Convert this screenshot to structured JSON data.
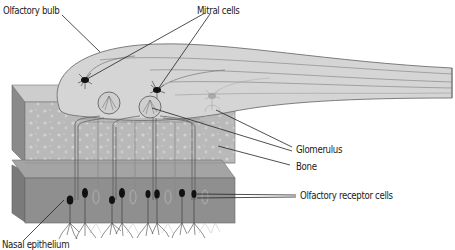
{
  "diagram": {
    "labels": {
      "olfactory_bulb": "Olfactory bulb",
      "mitral_cells": "Mitral cells",
      "glomerulus": "Glomerulus",
      "bone": "Bone",
      "olfactory_receptor_cells": "Olfactory receptor cells",
      "nasal_epithelium": "Nasal epithelium"
    },
    "colors": {
      "bulb_fill": "#d4d4d4",
      "bulb_stroke": "#777777",
      "top_layer": "#cfcfcf",
      "bone_fill": "#b8b8b8",
      "bone_dots": "#d0d0d0",
      "epithelium_top": "#a6a6a6",
      "epithelium_front": "#8f8f8f",
      "side_face": "#7d7d7d",
      "cell_body": "#1a1a1a",
      "leader_line": "#222222",
      "text": "#222222"
    }
  }
}
